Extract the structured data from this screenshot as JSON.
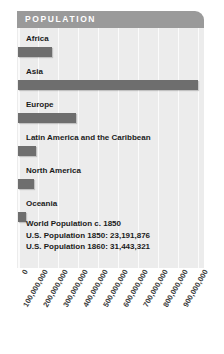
{
  "header": {
    "title": "POPULATION"
  },
  "colors": {
    "header_band": "#9a9a9a",
    "plot_background": "#ececec",
    "gridline": "#fbfbfb",
    "bar": "#6e6e6e",
    "text": "#1b1b1b"
  },
  "chart_data": {
    "type": "bar",
    "orientation": "horizontal",
    "title": "POPULATION",
    "xlabel": "",
    "ylabel": "",
    "grid": true,
    "legend": "none",
    "xlim": [
      0,
      950000000
    ],
    "categories": [
      "Africa",
      "Asia",
      "Europe",
      "Latin America and the Caribbean",
      "North America",
      "Oceania"
    ],
    "values": [
      170000000,
      900000000,
      290000000,
      90000000,
      80000000,
      40000000
    ],
    "tick_labels": [
      "0",
      "100,000,000",
      "200,000,000",
      "300,000,000",
      "400,000,000",
      "500,000,000",
      "600,000,000",
      "700,000,000",
      "800,000,000",
      "900,000,000"
    ],
    "tick_values": [
      0,
      100000000,
      200000000,
      300000000,
      400000000,
      500000000,
      600000000,
      700000000,
      800000000,
      900000000
    ],
    "annotations": [
      "World Population c. 1850",
      "U.S. Population 1850: 23,191,876",
      "U.S. Population 1860: 31,443,321"
    ]
  }
}
